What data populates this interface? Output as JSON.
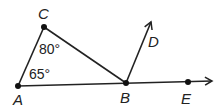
{
  "diagram": {
    "points": {
      "A": {
        "label": "A",
        "x": 18,
        "y": 86
      },
      "B": {
        "label": "B",
        "x": 126,
        "y": 83
      },
      "C": {
        "label": "C",
        "x": 44,
        "y": 27
      },
      "D": {
        "label": "D"
      },
      "E": {
        "label": "E",
        "x": 188,
        "y": 82
      }
    },
    "angles": {
      "angle_C": "80°",
      "angle_A": "65°"
    },
    "colors": {
      "stroke": "#222222",
      "background": "#ffffff"
    }
  }
}
